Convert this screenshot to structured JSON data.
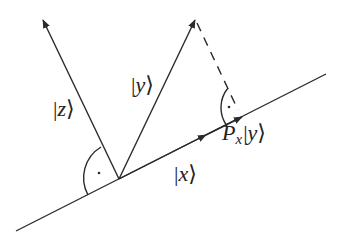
{
  "diagram": {
    "type": "vector-projection",
    "colors": {
      "stroke": "#2a2a2a",
      "background": "#ffffff"
    },
    "origin": [
      119,
      179
    ],
    "baseline": {
      "name": "x-axis-line",
      "from": [
        16,
        231
      ],
      "to": [
        326,
        74
      ]
    },
    "vectors": [
      {
        "name": "vector-z",
        "label": "|z⟩",
        "from": [
          119,
          179
        ],
        "to": [
          43,
          20
        ]
      },
      {
        "name": "vector-y",
        "label": "|y⟩",
        "from": [
          119,
          179
        ],
        "to": [
          195,
          20
        ]
      },
      {
        "name": "vector-x",
        "label": "|x⟩",
        "from": [
          119,
          179
        ],
        "to": [
          205,
          135
        ]
      },
      {
        "name": "projection-Px-y",
        "label": "P_x|y⟩",
        "from": [
          119,
          179
        ],
        "to": [
          241,
          117
        ]
      }
    ],
    "dashed_projection": {
      "from": [
        195,
        20
      ],
      "to": [
        241,
        117
      ]
    },
    "right_angle_markers": [
      {
        "name": "right-angle-z-x",
        "vertex": [
          119,
          179
        ],
        "symbol": "·"
      },
      {
        "name": "right-angle-dashed-x",
        "vertex": [
          241,
          117
        ],
        "symbol": "·"
      }
    ],
    "labels": {
      "z": {
        "open": "|",
        "letter": "z",
        "close": "⟩"
      },
      "y": {
        "open": "|",
        "letter": "y",
        "close": "⟩"
      },
      "x": {
        "open": "|",
        "letter": "x",
        "close": "⟩"
      },
      "proj": {
        "op": "P",
        "sub": "x",
        "open": "|",
        "letter": "y",
        "close": "⟩"
      }
    }
  }
}
